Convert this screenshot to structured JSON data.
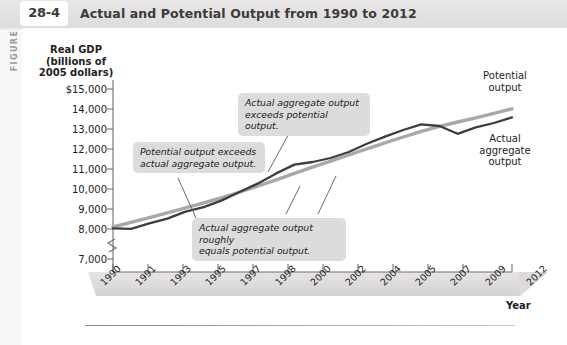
{
  "figure": {
    "side_label": "FIGURE",
    "number": "28-4",
    "title": "Actual and Potential Output from 1990 to 2012"
  },
  "chart_data": {
    "type": "line",
    "title": "Actual and Potential Output from 1990 to 2012",
    "xlabel": "Year",
    "ylabel": "Real GDP\n(billions of\n2005 dollars)",
    "ylabel_line1": "Real GDP",
    "ylabel_line2": "(billions of",
    "ylabel_line3": "2005 dollars)",
    "ylim": [
      7000,
      15000
    ],
    "ytick_labels": [
      "$15,000",
      "14,000",
      "13,000",
      "12,000",
      "11,000",
      "10,000",
      "9,000",
      "8,000",
      "7,000"
    ],
    "ytick_values": [
      15000,
      14000,
      13000,
      12000,
      11000,
      10000,
      9000,
      8000,
      7000
    ],
    "axis_break": true,
    "grid": false,
    "legend_position": "right-inline",
    "xtick_labels": [
      "1990",
      "1991",
      "1993",
      "1995",
      "1997",
      "1998",
      "2000",
      "2002",
      "2004",
      "2005",
      "2007",
      "2009",
      "2012"
    ],
    "x": [
      1990,
      1991,
      1992,
      1993,
      1994,
      1995,
      1996,
      1997,
      1998,
      1999,
      2000,
      2001,
      2002,
      2003,
      2004,
      2005,
      2006,
      2007,
      2008,
      2009,
      2010,
      2011,
      2012
    ],
    "series": [
      {
        "name": "Potential output",
        "color": "#a8a8a8",
        "values": [
          8100,
          8330,
          8570,
          8810,
          9060,
          9310,
          9570,
          9850,
          10150,
          10460,
          10780,
          11090,
          11390,
          11700,
          12010,
          12310,
          12600,
          12880,
          13130,
          13350,
          13560,
          13780,
          14010
        ]
      },
      {
        "name": "Actual aggregate output",
        "color": "#3d3d3d",
        "values": [
          8030,
          8010,
          8280,
          8520,
          8870,
          9090,
          9430,
          9860,
          10280,
          10780,
          11220,
          11350,
          11550,
          11850,
          12260,
          12620,
          12950,
          13230,
          13150,
          12760,
          13080,
          13300,
          13580
        ]
      }
    ],
    "annotations": [
      {
        "id": "potential-exceeds-actual",
        "text": "Potential output exceeds\nactual aggregate output."
      },
      {
        "id": "actual-exceeds-potential",
        "text": "Actual aggregate output\nexceeds potential output."
      },
      {
        "id": "actual-roughly-equals-potential",
        "text": "Actual aggregate output roughly\nequals potential output."
      }
    ],
    "series_labels": [
      {
        "id": "potential-output-label",
        "text": "Potential\noutput"
      },
      {
        "id": "actual-output-label",
        "text": "Actual\naggregate\noutput"
      }
    ]
  }
}
